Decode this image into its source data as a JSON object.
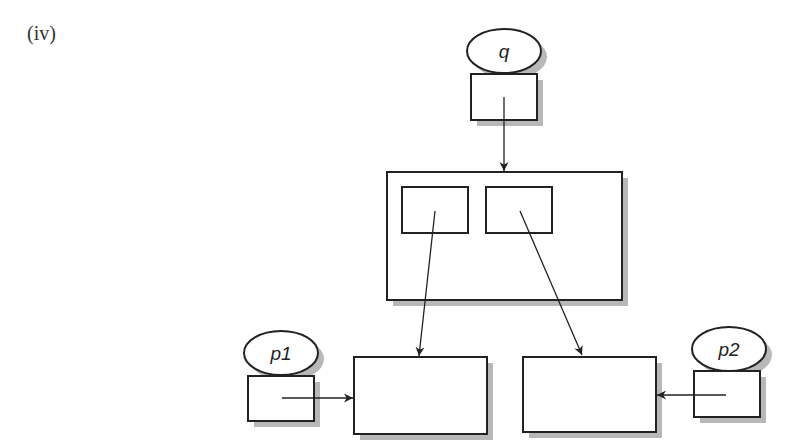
{
  "figure": {
    "label": "(iv)"
  },
  "colors": {
    "stroke": "#222222",
    "shadow": "#b8b8b8",
    "fill": "#ffffff",
    "text": "#222222"
  },
  "nodes": {
    "q": {
      "label": "q"
    },
    "p1": {
      "label": "p1"
    },
    "p2": {
      "label": "p2"
    }
  },
  "diagram": {
    "elements": [
      {
        "id": "q-ellipse",
        "type": "ellipse",
        "label": "q"
      },
      {
        "id": "q-box",
        "type": "box"
      },
      {
        "id": "container",
        "type": "box",
        "children": [
          "slot-left",
          "slot-right"
        ]
      },
      {
        "id": "target-left",
        "type": "box"
      },
      {
        "id": "target-right",
        "type": "box"
      },
      {
        "id": "p1-ellipse",
        "type": "ellipse",
        "label": "p1"
      },
      {
        "id": "p1-box",
        "type": "box"
      },
      {
        "id": "p2-ellipse",
        "type": "ellipse",
        "label": "p2"
      },
      {
        "id": "p2-box",
        "type": "box"
      }
    ],
    "edges": [
      {
        "from": "q-box",
        "to": "container"
      },
      {
        "from": "slot-left",
        "to": "target-left"
      },
      {
        "from": "slot-right",
        "to": "target-right"
      },
      {
        "from": "p1-box",
        "to": "target-left"
      },
      {
        "from": "p2-box",
        "to": "target-right"
      }
    ]
  }
}
